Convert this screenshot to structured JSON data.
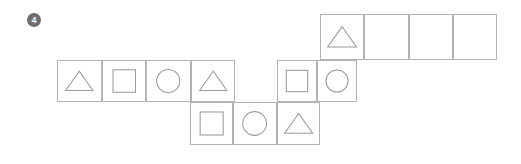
{
  "exercise": {
    "number_label": "4",
    "marker_icon": "filled-circle-number-marker",
    "marker_color": "#6e6e6e",
    "marker_text_color": "#ffffff"
  },
  "style": {
    "background": "#ffffff",
    "cell_border_color": "#b3b3b3",
    "shape_stroke_color": "#9a9a9a"
  },
  "grid": {
    "description": "Shape sequence pattern strip",
    "rows": [
      {
        "name": "top-row",
        "x": 320,
        "y": 14,
        "cell_width": 44.25,
        "cell_height": 46,
        "cells": [
          {
            "shape": "triangle",
            "empty": false
          },
          {
            "shape": "",
            "empty": true
          },
          {
            "shape": "",
            "empty": true
          },
          {
            "shape": "",
            "empty": true
          }
        ]
      },
      {
        "name": "middle-row-left",
        "x": 57,
        "y": 60,
        "cell_width": 44.5,
        "cell_height": 42,
        "cells": [
          {
            "shape": "triangle",
            "empty": false
          },
          {
            "shape": "square",
            "empty": false
          },
          {
            "shape": "circle",
            "empty": false
          },
          {
            "shape": "triangle",
            "empty": false
          }
        ]
      },
      {
        "name": "middle-row-right",
        "x": 277,
        "y": 60,
        "cell_width": 40,
        "cell_height": 42,
        "cells": [
          {
            "shape": "square",
            "empty": false
          },
          {
            "shape": "circle",
            "empty": false
          }
        ]
      },
      {
        "name": "bottom-row",
        "x": 190,
        "y": 102,
        "cell_width": 43.33,
        "cell_height": 43,
        "cells": [
          {
            "shape": "square",
            "empty": false
          },
          {
            "shape": "circle",
            "empty": false
          },
          {
            "shape": "triangle",
            "empty": false
          }
        ]
      }
    ]
  }
}
